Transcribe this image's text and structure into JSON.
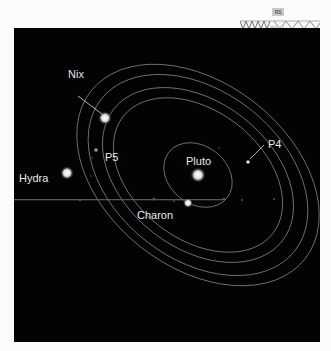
{
  "image": {
    "description": "Hubble image of Pluto system with orbits of moons",
    "labels": {
      "pluto": "Pluto",
      "charon": "Charon",
      "nix": "Nix",
      "hydra": "Hydra",
      "p4": "P4",
      "p5": "P5"
    }
  },
  "overlay": {
    "tag": "ЯS"
  },
  "colors": {
    "background": "#030303",
    "label": "#e8e8e8",
    "orbit": "#bdbdbd",
    "page": "#fbfbfb"
  }
}
